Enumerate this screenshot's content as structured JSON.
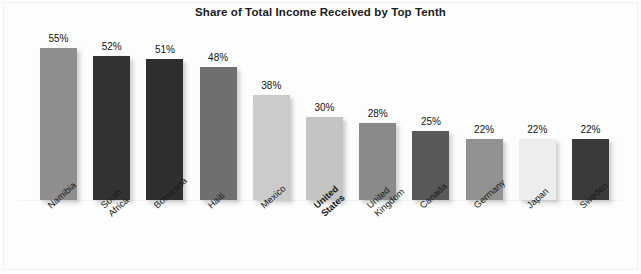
{
  "chart_data": {
    "type": "bar",
    "title": "Share of Total Income Received by Top Tenth",
    "xlabel": "",
    "ylabel": "",
    "ylim": [
      0,
      60
    ],
    "grid": false,
    "legend": null,
    "value_suffix": "%",
    "highlight_category": "United States",
    "categories": [
      "Namibia",
      "South Africa",
      "Botswana",
      "Haiti",
      "Mexico",
      "United States",
      "United Kingdom",
      "Canada",
      "Germany",
      "Japan",
      "Sweden"
    ],
    "values": [
      55,
      52,
      51,
      48,
      38,
      30,
      28,
      25,
      22,
      22,
      22
    ],
    "value_labels": [
      "55%",
      "52%",
      "51%",
      "48%",
      "38%",
      "30%",
      "28%",
      "25%",
      "22%",
      "22%",
      "22%"
    ],
    "bar_colors": [
      "#8e8e8e",
      "#323232",
      "#2e2e2e",
      "#6f6f6f",
      "#cbcbcb",
      "#c4c4c4",
      "#8a8a8a",
      "#595959",
      "#919191",
      "#ededed",
      "#3a3a3a"
    ],
    "bars": [
      {
        "category": "Namibia",
        "label_text": "Namibia",
        "value": 55,
        "value_label": "55%",
        "color": "#8e8e8e",
        "bold_label": false
      },
      {
        "category": "South Africa",
        "label_text": "South Africa",
        "value": 52,
        "value_label": "52%",
        "color": "#323232",
        "bold_label": false
      },
      {
        "category": "Botswana",
        "label_text": "Botswana",
        "value": 51,
        "value_label": "51%",
        "color": "#2e2e2e",
        "bold_label": false
      },
      {
        "category": "Haiti",
        "label_text": "Haiti",
        "value": 48,
        "value_label": "48%",
        "color": "#6f6f6f",
        "bold_label": false
      },
      {
        "category": "Mexico",
        "label_text": "Mexico",
        "value": 38,
        "value_label": "38%",
        "color": "#cbcbcb",
        "bold_label": false
      },
      {
        "category": "United States",
        "label_text": "United States",
        "value": 30,
        "value_label": "30%",
        "color": "#c4c4c4",
        "bold_label": true
      },
      {
        "category": "United Kingdom",
        "label_text": "United\nKingdom",
        "value": 28,
        "value_label": "28%",
        "color": "#8a8a8a",
        "bold_label": false
      },
      {
        "category": "Canada",
        "label_text": "Canada",
        "value": 25,
        "value_label": "25%",
        "color": "#595959",
        "bold_label": false
      },
      {
        "category": "Germany",
        "label_text": "Germany",
        "value": 22,
        "value_label": "22%",
        "color": "#919191",
        "bold_label": false
      },
      {
        "category": "Japan",
        "label_text": "Japan",
        "value": 22,
        "value_label": "22%",
        "color": "#ededed",
        "bold_label": false
      },
      {
        "category": "Sweden",
        "label_text": "Sweden",
        "value": 22,
        "value_label": "22%",
        "color": "#3a3a3a",
        "bold_label": false
      }
    ]
  }
}
